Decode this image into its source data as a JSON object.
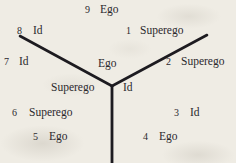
{
  "figure": {
    "background_color": "#efece4",
    "ink_color": "#26242a",
    "terms": [
      "Id",
      "Ego",
      "Superego"
    ],
    "junction": {
      "x": 112,
      "y": 86
    },
    "arms": [
      {
        "name": "upper-left-arm",
        "x1": 20,
        "y1": 36,
        "x2": 112,
        "y2": 86
      },
      {
        "name": "upper-right-arm",
        "x1": 207,
        "y1": 35,
        "x2": 112,
        "y2": 86
      },
      {
        "name": "lower-stem",
        "x1": 112,
        "y1": 86,
        "x2": 112,
        "y2": 163
      }
    ],
    "numbered_labels": [
      {
        "number": "1",
        "term": "Superego"
      },
      {
        "number": "2",
        "term": "Superego"
      },
      {
        "number": "3",
        "term": "Id"
      },
      {
        "number": "4",
        "term": "Ego"
      },
      {
        "number": "5",
        "term": "Ego"
      },
      {
        "number": "6",
        "term": "Superego"
      },
      {
        "number": "7",
        "term": "Id"
      },
      {
        "number": "8",
        "term": "Id"
      },
      {
        "number": "9",
        "term": "Ego"
      }
    ],
    "sector_labels": [
      {
        "name": "top-sector",
        "term": "Ego"
      },
      {
        "name": "left-sector",
        "term": "Superego"
      },
      {
        "name": "right-sector",
        "term": "Id"
      }
    ]
  }
}
